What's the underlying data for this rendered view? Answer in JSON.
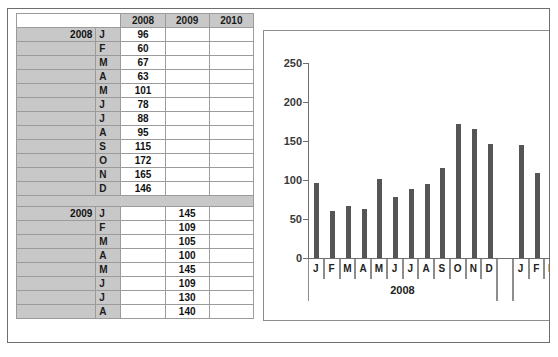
{
  "table": {
    "column_headers": [
      "2008",
      "2009",
      "2010"
    ],
    "sections": [
      {
        "year": "2008",
        "rows": [
          {
            "month": "J",
            "v2008": "96",
            "v2009": "",
            "v2010": ""
          },
          {
            "month": "F",
            "v2008": "60",
            "v2009": "",
            "v2010": ""
          },
          {
            "month": "M",
            "v2008": "67",
            "v2009": "",
            "v2010": ""
          },
          {
            "month": "A",
            "v2008": "63",
            "v2009": "",
            "v2010": ""
          },
          {
            "month": "M",
            "v2008": "101",
            "v2009": "",
            "v2010": ""
          },
          {
            "month": "J",
            "v2008": "78",
            "v2009": "",
            "v2010": ""
          },
          {
            "month": "J",
            "v2008": "88",
            "v2009": "",
            "v2010": ""
          },
          {
            "month": "A",
            "v2008": "95",
            "v2009": "",
            "v2010": ""
          },
          {
            "month": "S",
            "v2008": "115",
            "v2009": "",
            "v2010": ""
          },
          {
            "month": "O",
            "v2008": "172",
            "v2009": "",
            "v2010": ""
          },
          {
            "month": "N",
            "v2008": "165",
            "v2009": "",
            "v2010": ""
          },
          {
            "month": "D",
            "v2008": "146",
            "v2009": "",
            "v2010": ""
          }
        ]
      },
      {
        "year": "2009",
        "rows": [
          {
            "month": "J",
            "v2008": "",
            "v2009": "145",
            "v2010": ""
          },
          {
            "month": "F",
            "v2008": "",
            "v2009": "109",
            "v2010": ""
          },
          {
            "month": "M",
            "v2008": "",
            "v2009": "105",
            "v2010": ""
          },
          {
            "month": "A",
            "v2008": "",
            "v2009": "100",
            "v2010": ""
          },
          {
            "month": "M",
            "v2008": "",
            "v2009": "145",
            "v2010": ""
          },
          {
            "month": "J",
            "v2008": "",
            "v2009": "109",
            "v2010": ""
          },
          {
            "month": "J",
            "v2008": "",
            "v2009": "130",
            "v2010": ""
          },
          {
            "month": "A",
            "v2008": "",
            "v2009": "140",
            "v2010": ""
          }
        ]
      }
    ]
  },
  "chart_data": {
    "type": "bar",
    "title": "",
    "xlabel": "",
    "ylabel": "",
    "ylim": [
      0,
      250
    ],
    "ytick_labels": [
      "0",
      "50",
      "100",
      "150",
      "200",
      "250"
    ],
    "ytick_values": [
      0,
      50,
      100,
      150,
      200,
      250
    ],
    "grid": false,
    "legend": false,
    "bar_color": "#555555",
    "categories": [
      "J",
      "F",
      "M",
      "A",
      "M",
      "J",
      "J",
      "A",
      "S",
      "O",
      "N",
      "D",
      "",
      "J",
      "F",
      "M"
    ],
    "values": [
      96,
      60,
      67,
      63,
      101,
      78,
      88,
      95,
      115,
      172,
      165,
      146,
      null,
      145,
      109,
      105
    ],
    "groups": [
      {
        "label": "2008",
        "start": 0,
        "end": 11
      },
      {
        "label": "",
        "start": 12,
        "end": 12
      },
      {
        "label": "",
        "start": 13,
        "end": 15
      }
    ]
  }
}
